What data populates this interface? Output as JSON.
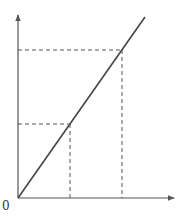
{
  "diagram": {
    "type": "linear-graph",
    "origin_label": "0",
    "axes": {
      "x": {
        "label": "",
        "arrow": true
      },
      "y": {
        "label": "",
        "arrow": true
      }
    },
    "line": {
      "from": [
        0,
        0
      ],
      "slope": "positive",
      "style": "solid"
    },
    "projections": [
      {
        "name": "point-1",
        "style": "dashed",
        "relative_x": 0.35,
        "relative_y": 0.41
      },
      {
        "name": "point-2",
        "style": "dashed",
        "relative_x": 0.68,
        "relative_y": 0.81
      }
    ],
    "colors": {
      "axis": "#555555",
      "line": "#444444",
      "dashed": "#555555",
      "background": "#ffffff"
    }
  }
}
